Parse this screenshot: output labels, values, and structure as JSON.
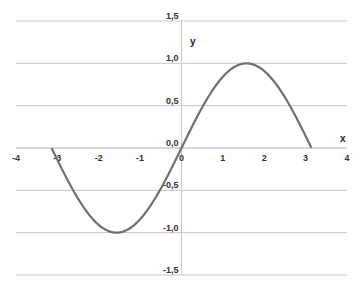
{
  "chart_data": {
    "type": "line",
    "title": "",
    "xlabel": "x",
    "ylabel": "y",
    "xlim": [
      -4,
      4
    ],
    "ylim": [
      -1.5,
      1.5
    ],
    "grid": {
      "horizontal": true,
      "vertical": false
    },
    "legend": null,
    "x_ticks": [
      "-4",
      "-3",
      "-2",
      "-1",
      "0",
      "1",
      "2",
      "3",
      "4"
    ],
    "y_ticks": [
      "1,5",
      "1,0",
      "0,5",
      "0,0",
      "-0,5",
      "-1,0",
      "-1,5"
    ],
    "series": [
      {
        "name": "y = sin(x)",
        "color": "#707070",
        "x": [
          -3.14,
          -2.8,
          -2.4,
          -2.0,
          -1.57,
          -1.2,
          -0.8,
          -0.4,
          0,
          0.4,
          0.8,
          1.2,
          1.57,
          2.0,
          2.4,
          2.8,
          3.14
        ],
        "y": [
          0,
          -0.33,
          -0.68,
          -0.91,
          -1.0,
          -0.93,
          -0.72,
          -0.39,
          0,
          0.39,
          0.72,
          0.93,
          1.0,
          0.91,
          0.68,
          0.33,
          0
        ]
      }
    ]
  }
}
